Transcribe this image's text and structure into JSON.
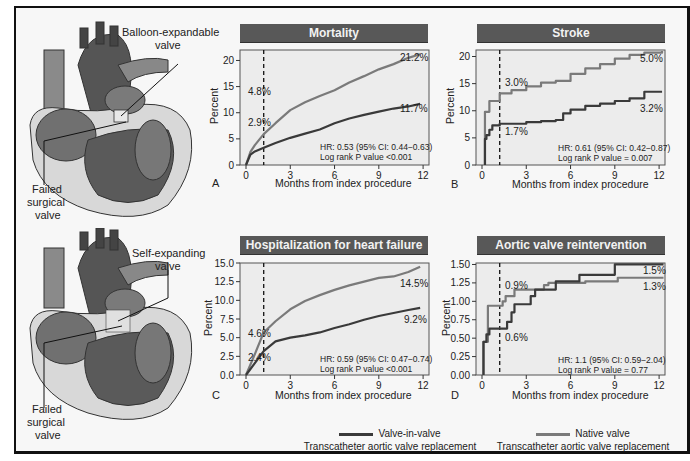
{
  "colors": {
    "valve_in_valve": "#3a3a3a",
    "native_valve": "#7a7a7a",
    "title_bar": "#585858",
    "plot_bg": "#ececec"
  },
  "illustrations": [
    {
      "name": "heart-balloon",
      "labels": [
        "Balloon-expandable",
        "valve"
      ],
      "callout_bottom": [
        "Failed",
        "surgical",
        "valve"
      ]
    },
    {
      "name": "heart-self",
      "labels": [
        "Self-expanding",
        "valve"
      ],
      "callout_bottom": [
        "Failed",
        "surgical",
        "valve"
      ]
    }
  ],
  "legend": {
    "vinv_line1": "Valve-in-valve",
    "vinv_line2": "Transcatheter aortic valve replacement",
    "native_line1": "Native valve",
    "native_line2": "Transcatheter aortic valve replacement"
  },
  "panels": [
    {
      "letter": "A",
      "title": "Mortality",
      "ylabel": "Percent",
      "xlabel": "Months from index procedure",
      "stats1": "HR: 0.53 (95% CI: 0.44−0.63)",
      "stats2": "Log rank P value <0.001"
    },
    {
      "letter": "B",
      "title": "Stroke",
      "ylabel": "Percent",
      "xlabel": "Months from index procedure",
      "stats1": "HR: 0.61 (95% CI: 0.42−0.87)",
      "stats2": "Log rank P value = 0.007"
    },
    {
      "letter": "C",
      "title": "Hospitalization for heart failure",
      "ylabel": "Percent",
      "xlabel": "Months from index procedure",
      "stats1": "HR: 0.59 (95% CI: 0.47−0.74)",
      "stats2": "Log rank P value <0.001"
    },
    {
      "letter": "D",
      "title": "Aortic valve reintervention",
      "ylabel": "Percent",
      "xlabel": "Months from index procedure",
      "stats1": "HR: 1.1 (95% CI: 0.59−2.04)",
      "stats2": "Log rank P value = 0.77"
    }
  ],
  "chart_data": [
    {
      "type": "line",
      "title": "Mortality",
      "panel": "A",
      "xlabel": "Months from index procedure",
      "ylabel": "Percent",
      "xlim": [
        0,
        12
      ],
      "ylim": [
        0,
        22
      ],
      "xticks": [
        0,
        3,
        6,
        9,
        12
      ],
      "yticks": [
        0,
        5,
        10,
        15,
        20
      ],
      "landmark_month": 1.2,
      "series": [
        {
          "name": "Native valve TAVR",
          "x": [
            0,
            0.3,
            0.6,
            1.2,
            2,
            3,
            4,
            5,
            6,
            7,
            8,
            9,
            10,
            11,
            11.8
          ],
          "values": [
            0,
            2.5,
            3.8,
            5.9,
            8,
            10.5,
            12,
            13.2,
            14.3,
            15.8,
            17,
            18.3,
            19.3,
            20.5,
            21.2
          ]
        },
        {
          "name": "Valve-in-valve TAVR",
          "x": [
            0,
            0.3,
            0.6,
            1.2,
            2,
            3,
            4,
            5,
            6,
            7,
            8,
            9,
            10,
            11,
            11.8
          ],
          "values": [
            0,
            2,
            2.6,
            3.3,
            4.2,
            5.2,
            6,
            6.8,
            8,
            8.9,
            9.6,
            10.2,
            10.8,
            11.2,
            11.7
          ]
        }
      ],
      "annotations": [
        "4.8%",
        "2.9%",
        "21.2%",
        "11.7%",
        "HR: 0.53 (95% CI: 0.44−0.63)",
        "Log rank P value <0.001"
      ]
    },
    {
      "type": "line",
      "title": "Stroke",
      "panel": "B",
      "xlabel": "Months from index procedure",
      "ylabel": "Percent",
      "xlim": [
        0,
        12
      ],
      "ylim": [
        0,
        21
      ],
      "xticks": [
        0,
        3,
        6,
        9,
        12
      ],
      "yticks": [
        0,
        5,
        10,
        15,
        20
      ],
      "landmark_month": 1.2,
      "series": [
        {
          "name": "Native valve TAVR",
          "x": [
            0.2,
            0.2,
            0.5,
            1.2,
            2,
            3,
            4,
            5,
            6,
            7,
            8,
            9,
            10,
            11,
            12.2
          ],
          "values": [
            0,
            9.8,
            11.8,
            13.2,
            13.8,
            14.5,
            15.2,
            15.5,
            16.8,
            17.8,
            18.6,
            19.6,
            20.3,
            20.7,
            21
          ]
        },
        {
          "name": "Valve-in-valve TAVR",
          "x": [
            0.2,
            0.2,
            0.3,
            0.5,
            0.7,
            1.2,
            2,
            3,
            4,
            5,
            5.5,
            6,
            7,
            8,
            9,
            10,
            11,
            12.2
          ],
          "values": [
            0,
            4.8,
            5.5,
            6.5,
            7.3,
            7.6,
            7.6,
            7.9,
            8.1,
            8.3,
            9.5,
            10.2,
            10.9,
            11.3,
            11.8,
            12.3,
            13.5,
            13.5
          ]
        }
      ],
      "annotations": [
        "3.0%",
        "1.7%",
        "5.0%",
        "3.2%",
        "HR: 0.61 (95% CI: 0.42−0.87)",
        "Log rank P value = 0.007"
      ]
    },
    {
      "type": "line",
      "title": "Hospitalization for heart failure",
      "panel": "C",
      "xlabel": "Months from index procedure",
      "ylabel": "Percent",
      "xlim": [
        0,
        12
      ],
      "ylim": [
        0,
        15
      ],
      "xticks": [
        0,
        3,
        6,
        9,
        12
      ],
      "yticks": [
        0.0,
        2.5,
        5.0,
        7.5,
        10.0,
        12.5,
        15.0
      ],
      "landmark_month": 1.2,
      "series": [
        {
          "name": "Native valve TAVR",
          "x": [
            0,
            0.6,
            1.2,
            2,
            3,
            4,
            5,
            6,
            7,
            8,
            9,
            10,
            11,
            11.8
          ],
          "values": [
            0,
            2.8,
            5.7,
            7.2,
            8.8,
            9.9,
            10.7,
            11.4,
            12,
            12.5,
            13,
            13.2,
            13.8,
            14.5
          ]
        },
        {
          "name": "Valve-in-valve TAVR",
          "x": [
            0,
            0.6,
            1.2,
            2,
            3,
            4,
            5,
            6,
            7,
            8,
            9,
            10,
            11,
            11.8
          ],
          "values": [
            0,
            1.6,
            3.2,
            4.5,
            5.0,
            5.3,
            5.7,
            6.3,
            6.8,
            7.4,
            7.9,
            8.3,
            8.7,
            9.0
          ]
        }
      ],
      "annotations": [
        "4.6%",
        "2.4%",
        "14.5%",
        "9.2%",
        "HR: 0.59 (95% CI: 0.47−0.74)",
        "Log rank P value <0.001"
      ]
    },
    {
      "type": "line",
      "title": "Aortic valve reintervention",
      "panel": "D",
      "xlabel": "Months from index procedure",
      "ylabel": "Percent",
      "xlim": [
        0,
        12
      ],
      "ylim": [
        0,
        1.5
      ],
      "xticks": [
        0,
        3,
        6,
        9,
        12
      ],
      "yticks": [
        0.0,
        0.25,
        0.5,
        0.75,
        1.0,
        1.25,
        1.5
      ],
      "landmark_month": 1.2,
      "series": [
        {
          "name": "Native valve TAVR",
          "x": [
            0.1,
            0.1,
            0.4,
            1.2,
            1.4,
            1.6,
            2.2,
            3.5,
            4.2,
            4.5,
            6.5,
            7,
            8.7,
            9.2,
            12.3
          ],
          "values": [
            0,
            0.45,
            0.94,
            0.94,
            1.0,
            1.07,
            1.16,
            1.16,
            1.22,
            1.25,
            1.25,
            1.27,
            1.27,
            1.32,
            1.32
          ]
        },
        {
          "name": "Valve-in-valve TAVR",
          "x": [
            0.1,
            0.1,
            0.3,
            0.5,
            1.2,
            1.7,
            2.0,
            2.2,
            3.3,
            3.6,
            5.0,
            6.6,
            9.0,
            12.3
          ],
          "values": [
            0,
            0.45,
            0.55,
            0.63,
            0.63,
            0.72,
            0.85,
            0.96,
            1.07,
            1.16,
            1.27,
            1.36,
            1.5,
            1.5
          ]
        }
      ],
      "annotations": [
        "0.9%",
        "0.6%",
        "1.5%",
        "1.3%",
        "HR: 1.1 (95% CI: 0.59−2.04)",
        "Log rank P value = 0.77"
      ]
    }
  ]
}
